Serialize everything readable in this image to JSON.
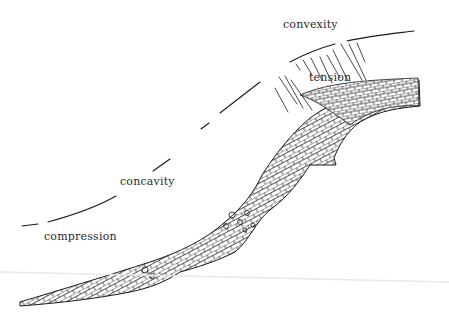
{
  "diagram": {
    "labels": {
      "convexity": "convexity",
      "tension": "tension",
      "concavity": "concavity",
      "compression": "compression"
    },
    "colors": {
      "ink": "#1a1a1a",
      "background": "#ffffff"
    }
  }
}
